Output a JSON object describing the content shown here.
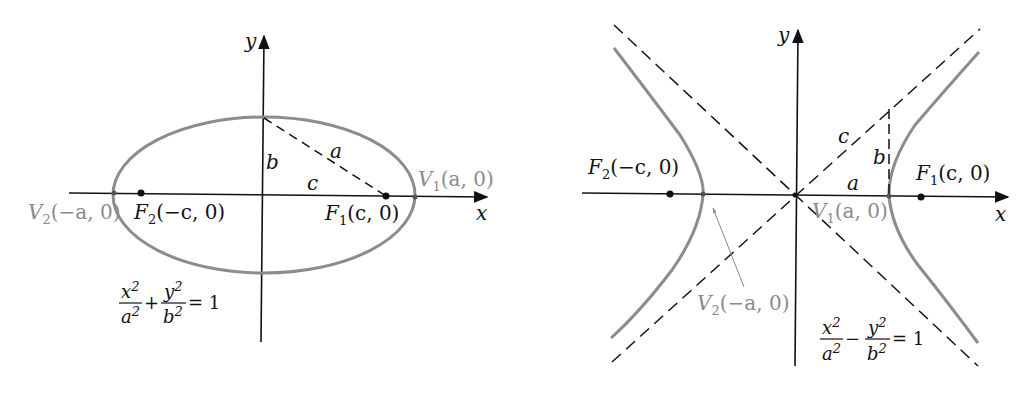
{
  "colors": {
    "axis": "#111111",
    "curve": "#8c8c8c",
    "gray_label": "#8a8a8a",
    "background": "#ffffff"
  },
  "ellipse_panel": {
    "axis_labels": {
      "x": "x",
      "y": "y"
    },
    "segment_labels": {
      "a": "a",
      "b": "b",
      "c": "c"
    },
    "vertex_right": {
      "name": "V",
      "sub": "1",
      "coords": "(a, 0)"
    },
    "vertex_left": {
      "name": "V",
      "sub": "2",
      "coords": "(−a, 0)"
    },
    "focus_right": {
      "name": "F",
      "sub": "1",
      "coords": "(c, 0)"
    },
    "focus_left": {
      "name": "F",
      "sub": "2",
      "coords": "(−c, 0)"
    },
    "equation": {
      "num1": "x",
      "den1": "a",
      "op": "+",
      "num2": "y",
      "den2": "b",
      "exp": "2",
      "rhs": "= 1"
    }
  },
  "hyperbola_panel": {
    "axis_labels": {
      "x": "x",
      "y": "y"
    },
    "segment_labels": {
      "a": "a",
      "b": "b",
      "c": "c"
    },
    "vertex_right": {
      "name": "V",
      "sub": "1",
      "coords": "(a, 0)"
    },
    "vertex_left": {
      "name": "V",
      "sub": "2",
      "coords": "(−a, 0)"
    },
    "focus_right": {
      "name": "F",
      "sub": "1",
      "coords": "(c, 0)"
    },
    "focus_left": {
      "name": "F",
      "sub": "2",
      "coords": "(−c, 0)"
    },
    "equation": {
      "num1": "x",
      "den1": "a",
      "op": "−",
      "num2": "y",
      "den2": "b",
      "exp": "2",
      "rhs": "= 1"
    }
  }
}
